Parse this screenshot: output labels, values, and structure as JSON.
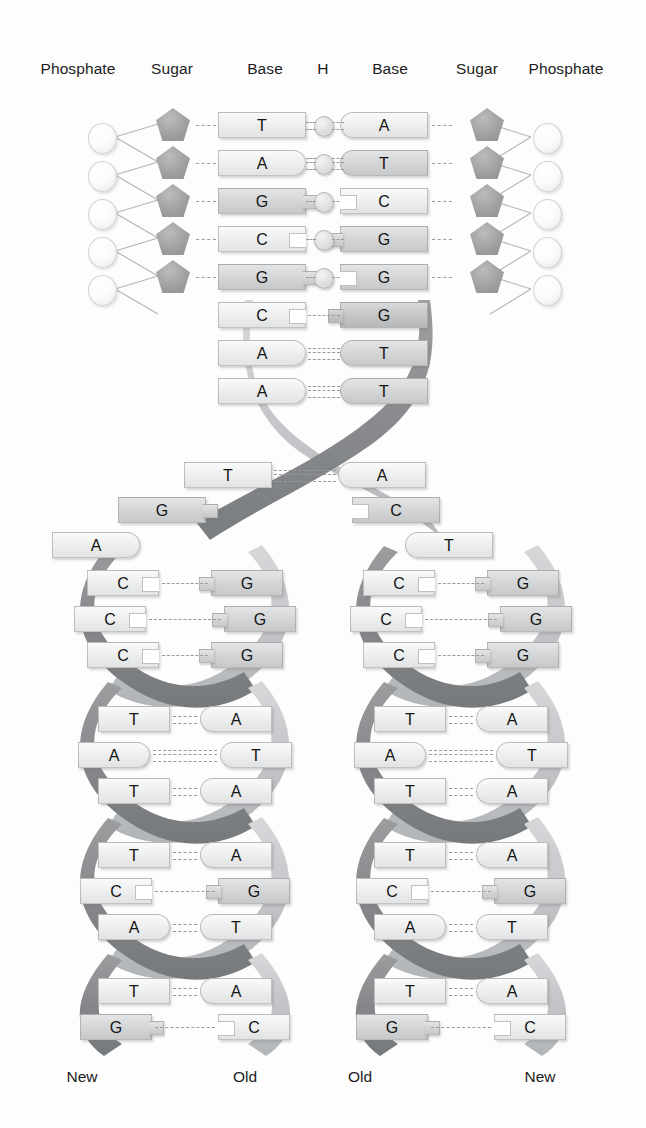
{
  "figure": {
    "background_color": "#fdfdfd"
  },
  "colors": {
    "ribbon_dark": "#8b8d8f",
    "ribbon_light": "#c3c5c7",
    "sugar_fill": "#9fa0a0",
    "phosphate_fill": "#fbfbfb",
    "base_light": "#eceded",
    "base_mid": "#d2d4d5",
    "base_dark": "#c2c4c6",
    "bond_dash": "#9a9a9a",
    "text": "#1a1a1a"
  },
  "column_headers": [
    {
      "label": "Phosphate",
      "x": 78
    },
    {
      "label": "Sugar",
      "x": 172
    },
    {
      "label": "Base",
      "x": 265
    },
    {
      "label": "H",
      "x": 323
    },
    {
      "label": "Base",
      "x": 390
    },
    {
      "label": "Sugar",
      "x": 477
    },
    {
      "label": "Phosphate",
      "x": 566
    }
  ],
  "ladder": {
    "description": "Unwound top portion of the double helix showing phosphate-sugar backbone, bases and hydrogen bonds",
    "rows": [
      {
        "y": 112,
        "left_base": "T",
        "right_base": "A",
        "hbonds": 2,
        "has_backbone": true,
        "left_shape": "block",
        "right_shape": "cap-left",
        "left_fill": "light",
        "right_fill": "light"
      },
      {
        "y": 150,
        "left_base": "A",
        "right_base": "T",
        "hbonds": 3,
        "has_backbone": true,
        "left_shape": "cap-right",
        "right_shape": "cap-left",
        "left_fill": "light",
        "right_fill": "mid"
      },
      {
        "y": 188,
        "left_base": "G",
        "right_base": "C",
        "hbonds": 1,
        "has_backbone": true,
        "left_shape": "tab-right",
        "right_shape": "notch-left",
        "left_fill": "mid",
        "right_fill": "light"
      },
      {
        "y": 226,
        "left_base": "C",
        "right_base": "G",
        "hbonds": 1,
        "has_backbone": true,
        "left_shape": "notch-right",
        "right_shape": "tab-left",
        "left_fill": "light",
        "right_fill": "mid"
      },
      {
        "y": 264,
        "left_base": "G",
        "right_base": "G",
        "hbonds": 1,
        "has_backbone": true,
        "left_shape": "tab-right",
        "right_shape": "notch-left",
        "left_fill": "mid",
        "right_fill": "mid"
      },
      {
        "y": 302,
        "left_base": "C",
        "right_base": "G",
        "hbonds": 1,
        "has_backbone": false,
        "left_shape": "notch-right",
        "right_shape": "tab-left",
        "left_fill": "light",
        "right_fill": "dark"
      },
      {
        "y": 340,
        "left_base": "A",
        "right_base": "T",
        "hbonds": 3,
        "has_backbone": false,
        "left_shape": "cap-right",
        "right_shape": "cap-left",
        "left_fill": "light",
        "right_fill": "mid"
      },
      {
        "y": 378,
        "left_base": "A",
        "right_base": "T",
        "hbonds": 3,
        "has_backbone": false,
        "left_shape": "cap-right",
        "right_shape": "cap-left",
        "left_fill": "light",
        "right_fill": "mid"
      }
    ]
  },
  "fork": {
    "description": "Replication fork where the parent strands separate",
    "pairs": [
      {
        "y": 462,
        "left_base": "T",
        "right_base": "A",
        "hbonds": 3,
        "joined": true,
        "left_x": 272,
        "right_x": 338,
        "left_shape": "block",
        "right_shape": "cap-left",
        "left_fill": "light",
        "right_fill": "light"
      },
      {
        "y": 497,
        "left_base": "G",
        "right_base": "C",
        "hbonds": 0,
        "joined": false,
        "left_x": 206,
        "right_x": 352,
        "left_shape": "tab-right",
        "right_shape": "notch-left",
        "left_fill": "mid",
        "right_fill": "mid"
      },
      {
        "y": 532,
        "left_base": "A",
        "right_base": "T",
        "hbonds": 0,
        "joined": false,
        "left_x": 140,
        "right_x": 405,
        "left_shape": "cap-right",
        "right_shape": "cap-left",
        "left_fill": "light",
        "right_fill": "light"
      }
    ]
  },
  "branches": [
    {
      "name": "left-daughter-helix",
      "center_x": 185,
      "labels": {
        "left": "New",
        "right": "Old",
        "y": 1068,
        "left_x": 82,
        "right_x": 245
      },
      "rungs": [
        {
          "y": 570,
          "left_base": "C",
          "right_base": "G",
          "hbonds": 1,
          "width": 52,
          "left_fill": "light",
          "right_fill": "mid",
          "left_shape": "notch-right",
          "right_shape": "tab-left"
        },
        {
          "y": 606,
          "left_base": "C",
          "right_base": "G",
          "hbonds": 1,
          "width": 78,
          "left_fill": "light",
          "right_fill": "mid",
          "left_shape": "notch-right",
          "right_shape": "tab-left"
        },
        {
          "y": 642,
          "left_base": "C",
          "right_base": "G",
          "hbonds": 1,
          "width": 52,
          "left_fill": "light",
          "right_fill": "mid",
          "left_shape": "notch-right",
          "right_shape": "tab-left"
        },
        {
          "y": 706,
          "left_base": "T",
          "right_base": "A",
          "hbonds": 2,
          "width": 30,
          "left_fill": "light",
          "right_fill": "light",
          "left_shape": "block",
          "right_shape": "cap-left"
        },
        {
          "y": 742,
          "left_base": "A",
          "right_base": "T",
          "hbonds": 3,
          "width": 70,
          "left_fill": "light",
          "right_fill": "light",
          "left_shape": "cap-right",
          "right_shape": "cap-left"
        },
        {
          "y": 778,
          "left_base": "T",
          "right_base": "A",
          "hbonds": 2,
          "width": 30,
          "left_fill": "light",
          "right_fill": "light",
          "left_shape": "block",
          "right_shape": "cap-left"
        },
        {
          "y": 842,
          "left_base": "T",
          "right_base": "A",
          "hbonds": 2,
          "width": 30,
          "left_fill": "light",
          "right_fill": "light",
          "left_shape": "block",
          "right_shape": "cap-left"
        },
        {
          "y": 878,
          "left_base": "C",
          "right_base": "G",
          "hbonds": 1,
          "width": 66,
          "left_fill": "light",
          "right_fill": "mid",
          "left_shape": "notch-right",
          "right_shape": "tab-left"
        },
        {
          "y": 914,
          "left_base": "A",
          "right_base": "T",
          "hbonds": 2,
          "width": 30,
          "left_fill": "light",
          "right_fill": "light",
          "left_shape": "cap-right",
          "right_shape": "cap-left"
        },
        {
          "y": 978,
          "left_base": "T",
          "right_base": "A",
          "hbonds": 2,
          "width": 30,
          "left_fill": "light",
          "right_fill": "light",
          "left_shape": "block",
          "right_shape": "cap-left"
        },
        {
          "y": 1014,
          "left_base": "G",
          "right_base": "C",
          "hbonds": 1,
          "width": 66,
          "left_fill": "mid",
          "right_fill": "light",
          "left_shape": "tab-right",
          "right_shape": "notch-left"
        }
      ]
    },
    {
      "name": "right-daughter-helix",
      "center_x": 461,
      "labels": {
        "left": "Old",
        "right": "New",
        "y": 1068,
        "left_x": 360,
        "right_x": 540
      },
      "rungs": [
        {
          "y": 570,
          "left_base": "C",
          "right_base": "G",
          "hbonds": 1,
          "width": 52,
          "left_fill": "light",
          "right_fill": "mid",
          "left_shape": "notch-right",
          "right_shape": "tab-left"
        },
        {
          "y": 606,
          "left_base": "C",
          "right_base": "G",
          "hbonds": 1,
          "width": 78,
          "left_fill": "light",
          "right_fill": "mid",
          "left_shape": "notch-right",
          "right_shape": "tab-left"
        },
        {
          "y": 642,
          "left_base": "C",
          "right_base": "G",
          "hbonds": 1,
          "width": 52,
          "left_fill": "light",
          "right_fill": "mid",
          "left_shape": "notch-right",
          "right_shape": "tab-left"
        },
        {
          "y": 706,
          "left_base": "T",
          "right_base": "A",
          "hbonds": 2,
          "width": 30,
          "left_fill": "light",
          "right_fill": "light",
          "left_shape": "block",
          "right_shape": "cap-left"
        },
        {
          "y": 742,
          "left_base": "A",
          "right_base": "T",
          "hbonds": 3,
          "width": 70,
          "left_fill": "light",
          "right_fill": "light",
          "left_shape": "cap-right",
          "right_shape": "cap-left"
        },
        {
          "y": 778,
          "left_base": "T",
          "right_base": "A",
          "hbonds": 2,
          "width": 30,
          "left_fill": "light",
          "right_fill": "light",
          "left_shape": "block",
          "right_shape": "cap-left"
        },
        {
          "y": 842,
          "left_base": "T",
          "right_base": "A",
          "hbonds": 2,
          "width": 30,
          "left_fill": "light",
          "right_fill": "light",
          "left_shape": "block",
          "right_shape": "cap-left"
        },
        {
          "y": 878,
          "left_base": "C",
          "right_base": "G",
          "hbonds": 1,
          "width": 66,
          "left_fill": "light",
          "right_fill": "mid",
          "left_shape": "notch-right",
          "right_shape": "tab-left"
        },
        {
          "y": 914,
          "left_base": "A",
          "right_base": "T",
          "hbonds": 2,
          "width": 30,
          "left_fill": "light",
          "right_fill": "light",
          "left_shape": "cap-right",
          "right_shape": "cap-left"
        },
        {
          "y": 978,
          "left_base": "T",
          "right_base": "A",
          "hbonds": 2,
          "width": 30,
          "left_fill": "light",
          "right_fill": "light",
          "left_shape": "block",
          "right_shape": "cap-left"
        },
        {
          "y": 1014,
          "left_base": "G",
          "right_base": "C",
          "hbonds": 1,
          "width": 66,
          "left_fill": "mid",
          "right_fill": "light",
          "left_shape": "tab-right",
          "right_shape": "notch-left"
        }
      ]
    }
  ]
}
